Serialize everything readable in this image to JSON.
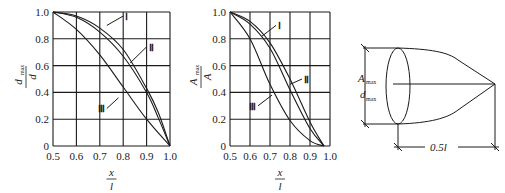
{
  "chart_data": [
    {
      "type": "line",
      "title": "",
      "xlabel": "x / l",
      "ylabel": "d_max / d",
      "xlim": [
        0.5,
        1.0
      ],
      "ylim": [
        0,
        1.0
      ],
      "grid": true,
      "x_ticks": [
        "0.5",
        "0.6",
        "0.7",
        "0.8",
        "0.9",
        "1.0"
      ],
      "y_ticks": [
        "0",
        "0.2",
        "0.4",
        "0.6",
        "0.8",
        "1.0"
      ],
      "series": [
        {
          "name": "I",
          "x": [
            0.5,
            0.6,
            0.7,
            0.8,
            0.9,
            0.95,
            1.0
          ],
          "y": [
            1.0,
            0.97,
            0.88,
            0.72,
            0.43,
            0.25,
            0
          ]
        },
        {
          "name": "II",
          "x": [
            0.5,
            0.6,
            0.7,
            0.8,
            0.9,
            0.95,
            1.0
          ],
          "y": [
            1.0,
            0.96,
            0.85,
            0.67,
            0.4,
            0.21,
            0
          ]
        },
        {
          "name": "III",
          "x": [
            0.5,
            0.6,
            0.7,
            0.8,
            0.9,
            1.0
          ],
          "y": [
            1.0,
            0.87,
            0.68,
            0.44,
            0.2,
            0
          ]
        }
      ],
      "annotations": [
        "I",
        "II",
        "III"
      ]
    },
    {
      "type": "line",
      "title": "",
      "xlabel": "x / l",
      "ylabel": "A_max / A",
      "xlim": [
        0.5,
        1.0
      ],
      "ylim": [
        0,
        1.0
      ],
      "grid": true,
      "x_ticks": [
        "0.5",
        "0.6",
        "0.7",
        "0.8",
        "0.9",
        "1.0"
      ],
      "y_ticks": [
        "0",
        "0.2",
        "0.4",
        "0.6",
        "0.8",
        "1.0"
      ],
      "series": [
        {
          "name": "I",
          "x": [
            0.5,
            0.6,
            0.7,
            0.8,
            0.9,
            0.97
          ],
          "y": [
            1.0,
            0.93,
            0.77,
            0.5,
            0.18,
            0
          ]
        },
        {
          "name": "II",
          "x": [
            0.5,
            0.6,
            0.7,
            0.8,
            0.9,
            0.97
          ],
          "y": [
            1.0,
            0.91,
            0.73,
            0.42,
            0.13,
            0
          ]
        },
        {
          "name": "III",
          "x": [
            0.5,
            0.6,
            0.7,
            0.8,
            0.9,
            0.97
          ],
          "y": [
            1.0,
            0.8,
            0.46,
            0.19,
            0.04,
            0
          ]
        }
      ],
      "annotations": [
        "I",
        "II",
        "III"
      ]
    }
  ],
  "diagram": {
    "labels": {
      "a_max": "A",
      "a_max_sub": "max",
      "d_max": "d",
      "d_max_sub": "max",
      "length": "0.5l"
    }
  },
  "charts": [
    {
      "ylabel_num": "d",
      "ylabel_num_sub": "max",
      "ylabel_den": "d",
      "xlabel_num": "x",
      "xlabel_den": "l",
      "curve_labels": [
        "I",
        "II",
        "III"
      ]
    },
    {
      "ylabel_num": "A",
      "ylabel_num_sub": "max",
      "ylabel_den": "A",
      "xlabel_num": "x",
      "xlabel_den": "l",
      "curve_labels": [
        "I",
        "II",
        "III"
      ]
    }
  ]
}
